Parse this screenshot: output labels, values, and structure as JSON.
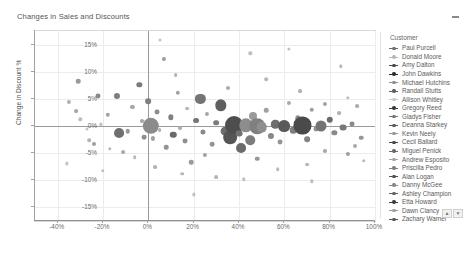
{
  "header": {
    "title": "Changes in Sales and Discounts",
    "collapse_icon": "minus-icon"
  },
  "legend": {
    "title": "Customer",
    "scroll_up_icon": "chevron-up-icon",
    "scroll_down_icon": "chevron-down-icon",
    "items": [
      {
        "label": "Paul Purcell",
        "color": "#6e6e6e"
      },
      {
        "label": "Donald Moore",
        "color": "#b9b9b9"
      },
      {
        "label": "Amy Dalton",
        "color": "#4a4a4a"
      },
      {
        "label": "John Dawkins",
        "color": "#2e2e2e"
      },
      {
        "label": "Michael Hutchins",
        "color": "#8f8f8f"
      },
      {
        "label": "Randall Stutts",
        "color": "#5e5e5e"
      },
      {
        "label": "Allison Whitley",
        "color": "#c9c9c9"
      },
      {
        "label": "Gregory Reed",
        "color": "#3a3a3a"
      },
      {
        "label": "Gladys Fisher",
        "color": "#777777"
      },
      {
        "label": "Deanna Starkey",
        "color": "#5a5a5a"
      },
      {
        "label": "Kevin Neely",
        "color": "#969696"
      },
      {
        "label": "Cecil Ballard",
        "color": "#454545"
      },
      {
        "label": "Miguel Penick",
        "color": "#6a6a6a"
      },
      {
        "label": "Andrew Esposito",
        "color": "#a5a5a5"
      },
      {
        "label": "Priscilla Pedro",
        "color": "#7e7e7e"
      },
      {
        "label": "Alan Logan",
        "color": "#505050"
      },
      {
        "label": "Danny McGee",
        "color": "#888888"
      },
      {
        "label": "Ashley Champion",
        "color": "#636363"
      },
      {
        "label": "Etta Howard",
        "color": "#3f3f3f"
      },
      {
        "label": "Dawn Clancy",
        "color": "#9e9e9e"
      },
      {
        "label": "Zachary Warner",
        "color": "#565656"
      }
    ]
  },
  "chart_data": {
    "type": "scatter",
    "title": "Changes in Sales and Discounts",
    "xlabel": "Change in Sales",
    "ylabel": "Change in Discount %",
    "xlim": [
      -50,
      100
    ],
    "ylim": [
      -17.5,
      17.5
    ],
    "xticks": [
      "-40%",
      "-20%",
      "0%",
      "20%",
      "40%",
      "60%",
      "80%",
      "100%"
    ],
    "xtick_values": [
      -40,
      -20,
      0,
      20,
      40,
      60,
      80,
      100
    ],
    "yticks": [
      "15%",
      "10%",
      "5%",
      "0%",
      "-5%",
      "-10%",
      "-15%"
    ],
    "ytick_values": [
      15,
      10,
      5,
      0,
      -5,
      -10,
      -15
    ],
    "grid": true,
    "legend_position": "right",
    "legend_title": "Customer",
    "size_encoding": "bubble area = sales volume",
    "points": [
      {
        "x": -31,
        "y": 8.2,
        "size": 2.4,
        "color": "#9a9a9a"
      },
      {
        "x": -35,
        "y": 4.4,
        "size": 2.2,
        "color": "#b0b0b0"
      },
      {
        "x": -32,
        "y": 2.7,
        "size": 2.0,
        "color": "#a8a8a8"
      },
      {
        "x": -30,
        "y": 1.2,
        "size": 1.8,
        "color": "#bdbdbd"
      },
      {
        "x": -27,
        "y": -0.6,
        "size": 1.6,
        "color": "#c4c4c4"
      },
      {
        "x": -26,
        "y": -2.6,
        "size": 1.9,
        "color": "#b5b5b5"
      },
      {
        "x": -24,
        "y": -3.4,
        "size": 2.1,
        "color": "#9f9f9f"
      },
      {
        "x": -22,
        "y": 5.5,
        "size": 2.6,
        "color": "#8a8a8a"
      },
      {
        "x": -21,
        "y": 0.3,
        "size": 1.7,
        "color": "#c0c0c0"
      },
      {
        "x": -18,
        "y": 2.0,
        "size": 2.3,
        "color": "#a2a2a2"
      },
      {
        "x": -17,
        "y": -4.2,
        "size": 1.8,
        "color": "#b8b8b8"
      },
      {
        "x": -14,
        "y": 5.6,
        "size": 3.2,
        "color": "#7d7d7d"
      },
      {
        "x": -13,
        "y": -1.3,
        "size": 5.2,
        "color": "#6f6f6f"
      },
      {
        "x": -11,
        "y": -4.8,
        "size": 2.0,
        "color": "#acacac"
      },
      {
        "x": -9,
        "y": -1.0,
        "size": 2.4,
        "color": "#989898"
      },
      {
        "x": -7,
        "y": 3.5,
        "size": 2.2,
        "color": "#a6a6a6"
      },
      {
        "x": -6,
        "y": -5.8,
        "size": 1.9,
        "color": "#bababa"
      },
      {
        "x": -4,
        "y": 7.6,
        "size": 2.8,
        "color": "#7a7a7a"
      },
      {
        "x": -3,
        "y": 0.9,
        "size": 2.1,
        "color": "#a3a3a3"
      },
      {
        "x": -2,
        "y": -2.1,
        "size": 2.5,
        "color": "#8f8f8f"
      },
      {
        "x": 0,
        "y": 4.6,
        "size": 3.0,
        "color": "#7f7f7f"
      },
      {
        "x": 1,
        "y": 0.0,
        "size": 8.6,
        "color": "#8b8b8b"
      },
      {
        "x": 2,
        "y": -2.3,
        "size": 2.2,
        "color": "#a0a0a0"
      },
      {
        "x": 4,
        "y": 2.5,
        "size": 2.6,
        "color": "#8c8c8c"
      },
      {
        "x": 5,
        "y": -0.7,
        "size": 2.0,
        "color": "#b2b2b2"
      },
      {
        "x": 7,
        "y": 12.3,
        "size": 2.2,
        "color": "#9c9c9c"
      },
      {
        "x": 8,
        "y": -3.9,
        "size": 2.4,
        "color": "#949494"
      },
      {
        "x": 10,
        "y": 1.6,
        "size": 2.8,
        "color": "#818181"
      },
      {
        "x": 11,
        "y": -1.6,
        "size": 3.4,
        "color": "#6b6b6b"
      },
      {
        "x": 13,
        "y": 6.1,
        "size": 2.3,
        "color": "#a4a4a4"
      },
      {
        "x": 14,
        "y": -0.4,
        "size": 2.1,
        "color": "#ababab"
      },
      {
        "x": 16,
        "y": -2.8,
        "size": 2.6,
        "color": "#8e8e8e"
      },
      {
        "x": 17,
        "y": 3.2,
        "size": 2.0,
        "color": "#b4b4b4"
      },
      {
        "x": 19,
        "y": -6.7,
        "size": 2.4,
        "color": "#9b9b9b"
      },
      {
        "x": 21,
        "y": 1.0,
        "size": 3.1,
        "color": "#767676"
      },
      {
        "x": 23,
        "y": 5.0,
        "size": 5.4,
        "color": "#747474"
      },
      {
        "x": 24,
        "y": -1.1,
        "size": 2.7,
        "color": "#8a8a8a"
      },
      {
        "x": 26,
        "y": 2.2,
        "size": 2.2,
        "color": "#a7a7a7"
      },
      {
        "x": 28,
        "y": -3.3,
        "size": 2.5,
        "color": "#939393"
      },
      {
        "x": 30,
        "y": 0.6,
        "size": 3.0,
        "color": "#7b7b7b"
      },
      {
        "x": 32,
        "y": 3.8,
        "size": 6.0,
        "color": "#5f5f5f"
      },
      {
        "x": 34,
        "y": -0.9,
        "size": 4.6,
        "color": "#6d6d6d"
      },
      {
        "x": 36,
        "y": -2.0,
        "size": 7.2,
        "color": "#555555"
      },
      {
        "x": 38,
        "y": 0.2,
        "size": 9.4,
        "color": "#4e4e4e"
      },
      {
        "x": 40,
        "y": -1.4,
        "size": 3.6,
        "color": "#717171"
      },
      {
        "x": 41,
        "y": -4.0,
        "size": 5.2,
        "color": "#6a6a6a"
      },
      {
        "x": 43,
        "y": 0.1,
        "size": 7.0,
        "color": "#8d8d8d"
      },
      {
        "x": 45,
        "y": -2.6,
        "size": 5.0,
        "color": "#7c7c7c"
      },
      {
        "x": 46,
        "y": 1.8,
        "size": 4.2,
        "color": "#9a9a9a"
      },
      {
        "x": 48,
        "y": 0.0,
        "size": 8.2,
        "color": "#808080"
      },
      {
        "x": 50,
        "y": -0.2,
        "size": 5.6,
        "color": "#8f8f8f"
      },
      {
        "x": 52,
        "y": 2.9,
        "size": 2.4,
        "color": "#a0a0a0"
      },
      {
        "x": 54,
        "y": -1.8,
        "size": 3.2,
        "color": "#888888"
      },
      {
        "x": 56,
        "y": 0.3,
        "size": 4.4,
        "color": "#6e6e6e"
      },
      {
        "x": 58,
        "y": -3.0,
        "size": 2.6,
        "color": "#959595"
      },
      {
        "x": 60,
        "y": 0.0,
        "size": 6.2,
        "color": "#5a5a5a"
      },
      {
        "x": 62,
        "y": 4.2,
        "size": 2.2,
        "color": "#a9a9a9"
      },
      {
        "x": 64,
        "y": -0.8,
        "size": 3.4,
        "color": "#7e7e7e"
      },
      {
        "x": 66,
        "y": 1.4,
        "size": 2.8,
        "color": "#8b8b8b"
      },
      {
        "x": 68,
        "y": 0.1,
        "size": 9.0,
        "color": "#4a4a4a"
      },
      {
        "x": 70,
        "y": -2.4,
        "size": 3.0,
        "color": "#838383"
      },
      {
        "x": 72,
        "y": 3.0,
        "size": 2.4,
        "color": "#9d9d9d"
      },
      {
        "x": 74,
        "y": -0.5,
        "size": 2.6,
        "color": "#919191"
      },
      {
        "x": 76,
        "y": 0.0,
        "size": 5.8,
        "color": "#737373"
      },
      {
        "x": 78,
        "y": -4.6,
        "size": 2.2,
        "color": "#a5a5a5"
      },
      {
        "x": 80,
        "y": 1.1,
        "size": 3.4,
        "color": "#6c6c6c"
      },
      {
        "x": 82,
        "y": -1.2,
        "size": 2.8,
        "color": "#8a8a8a"
      },
      {
        "x": 84,
        "y": 2.4,
        "size": 2.0,
        "color": "#b1b1b1"
      },
      {
        "x": 86,
        "y": -0.3,
        "size": 3.6,
        "color": "#787878"
      },
      {
        "x": 88,
        "y": -5.2,
        "size": 2.2,
        "color": "#9e9e9e"
      },
      {
        "x": 90,
        "y": 0.4,
        "size": 2.6,
        "color": "#898989"
      },
      {
        "x": 92,
        "y": 3.6,
        "size": 2.0,
        "color": "#aeaeae"
      },
      {
        "x": 94,
        "y": -2.2,
        "size": 2.4,
        "color": "#969696"
      },
      {
        "x": 5,
        "y": 15.8,
        "size": 1.6,
        "color": "#c6c6c6"
      },
      {
        "x": 45,
        "y": 13.4,
        "size": 1.8,
        "color": "#bebebe"
      },
      {
        "x": 62,
        "y": 14.2,
        "size": 1.7,
        "color": "#c2c2c2"
      },
      {
        "x": 85,
        "y": 11.0,
        "size": 1.8,
        "color": "#bbbbbb"
      },
      {
        "x": 30,
        "y": -9.4,
        "size": 2.0,
        "color": "#b6b6b6"
      },
      {
        "x": 57,
        "y": -8.0,
        "size": 1.9,
        "color": "#b9b9b9"
      },
      {
        "x": 72,
        "y": -10.2,
        "size": 1.8,
        "color": "#bcbcbc"
      },
      {
        "x": 20,
        "y": -12.6,
        "size": 1.7,
        "color": "#c1c1c1"
      },
      {
        "x": 95,
        "y": -6.4,
        "size": 1.9,
        "color": "#b7b7b7"
      },
      {
        "x": -36,
        "y": -6.9,
        "size": 1.7,
        "color": "#c3c3c3"
      },
      {
        "x": -20,
        "y": -8.2,
        "size": 1.8,
        "color": "#bfbfbf"
      },
      {
        "x": 12,
        "y": 9.4,
        "size": 2.0,
        "color": "#b3b3b3"
      },
      {
        "x": 35,
        "y": 7.0,
        "size": 2.1,
        "color": "#adadad"
      },
      {
        "x": 52,
        "y": 8.6,
        "size": 1.9,
        "color": "#b8b8b8"
      },
      {
        "x": 67,
        "y": 6.4,
        "size": 2.0,
        "color": "#b0b0b0"
      },
      {
        "x": 88,
        "y": 5.2,
        "size": 1.8,
        "color": "#bdbdbd"
      },
      {
        "x": 25,
        "y": -5.4,
        "size": 2.2,
        "color": "#a1a1a1"
      },
      {
        "x": 48,
        "y": -6.0,
        "size": 2.4,
        "color": "#979797"
      },
      {
        "x": 70,
        "y": -7.1,
        "size": 2.0,
        "color": "#b4b4b4"
      },
      {
        "x": 91,
        "y": -3.6,
        "size": 2.1,
        "color": "#a8a8a8"
      },
      {
        "x": 15,
        "y": -8.8,
        "size": 1.9,
        "color": "#babaaa"
      },
      {
        "x": 42,
        "y": -9.8,
        "size": 1.8,
        "color": "#c0c0c0"
      },
      {
        "x": 78,
        "y": 4.0,
        "size": 2.2,
        "color": "#a4a4a4"
      },
      {
        "x": 3,
        "y": -7.6,
        "size": 2.0,
        "color": "#b2b2b2"
      }
    ]
  }
}
